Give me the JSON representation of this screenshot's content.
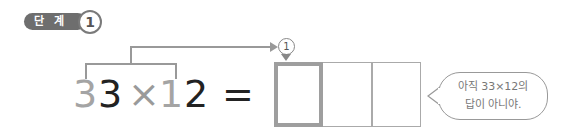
{
  "step_badge": {
    "label": "단 계",
    "number": "1"
  },
  "equation": {
    "digits": [
      {
        "char": "3",
        "highlight": true
      },
      {
        "char": "3",
        "highlight": false
      },
      {
        "char": "×",
        "highlight": false
      },
      {
        "char": "1",
        "highlight": true
      },
      {
        "char": "2",
        "highlight": false
      },
      {
        "char": "=",
        "highlight": false
      }
    ],
    "arrow_marker": "1"
  },
  "answer_boxes": {
    "count": 3,
    "active_index": 0
  },
  "speech_bubble": {
    "line1": "아직 33×12의",
    "line2": "답이 아니야."
  },
  "colors": {
    "highlight_gray": "#a4a4a4",
    "text_dark": "#222222",
    "badge_bg": "#6e6e6e",
    "line_gray": "#999999"
  }
}
